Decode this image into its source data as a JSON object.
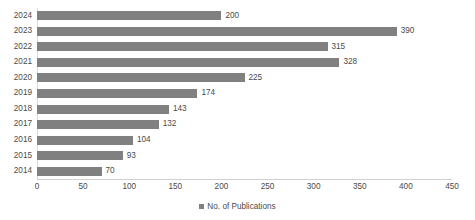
{
  "chart_data": {
    "type": "bar",
    "orientation": "horizontal",
    "title": "",
    "xlabel": "",
    "ylabel": "",
    "categories": [
      "2024",
      "2023",
      "2022",
      "2021",
      "2020",
      "2019",
      "2018",
      "2017",
      "2016",
      "2015",
      "2014"
    ],
    "values": [
      200,
      390,
      315,
      328,
      225,
      174,
      143,
      132,
      104,
      93,
      70
    ],
    "series": [
      {
        "name": "No. of Publications",
        "values": [
          200,
          390,
          315,
          328,
          225,
          174,
          143,
          132,
          104,
          93,
          70
        ],
        "color": "#808080"
      }
    ],
    "xlim": [
      0,
      450
    ],
    "xticks": [
      0,
      50,
      100,
      150,
      200,
      250,
      300,
      350,
      400,
      450
    ],
    "data_labels": [
      "200",
      "390",
      "315",
      "328",
      "225",
      "174",
      "143",
      "132",
      "104",
      "93",
      "70"
    ],
    "grid": false,
    "legend": {
      "position": "bottom",
      "entries": [
        "No. of Publications"
      ]
    }
  },
  "colors": {
    "bar": "#808080",
    "text": "#4a4a4a",
    "axis": "#d0d0d0",
    "background": "#ffffff"
  }
}
